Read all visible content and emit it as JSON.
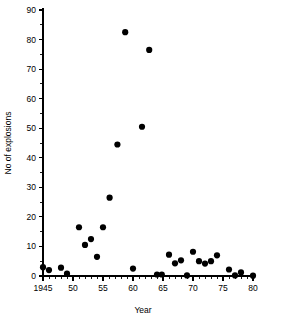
{
  "chart_data": {
    "type": "scatter",
    "title": "",
    "xlabel": "Year",
    "ylabel": "No of explosions",
    "xlim": [
      1945,
      1980
    ],
    "ylim": [
      0,
      90
    ],
    "grid": false,
    "legend": "none",
    "x_tick_labels": [
      "1945",
      "50",
      "55",
      "60",
      "65",
      "70",
      "75",
      "80"
    ],
    "x_tick_values": [
      1945,
      1950,
      1955,
      1960,
      1965,
      1970,
      1975,
      1980
    ],
    "x_minor_step": 1,
    "y_tick_labels": [
      "0",
      "10",
      "20",
      "30",
      "40",
      "50",
      "60",
      "70",
      "80",
      "90"
    ],
    "y_tick_values": [
      0,
      10,
      20,
      30,
      40,
      50,
      60,
      70,
      80,
      90
    ],
    "y_minor_step": 5,
    "marker": "filled-circle",
    "marker_color": "#000000",
    "marker_size_px": 3.1,
    "points": [
      {
        "x": 1945,
        "y": 3
      },
      {
        "x": 1946,
        "y": 2
      },
      {
        "x": 1948,
        "y": 2.8
      },
      {
        "x": 1949,
        "y": 0.8
      },
      {
        "x": 1951,
        "y": 16.5
      },
      {
        "x": 1952,
        "y": 10.5
      },
      {
        "x": 1953,
        "y": 12.5
      },
      {
        "x": 1954,
        "y": 6.5
      },
      {
        "x": 1955,
        "y": 16.5
      },
      {
        "x": 1956.1,
        "y": 26.5
      },
      {
        "x": 1957.4,
        "y": 44.5
      },
      {
        "x": 1958.7,
        "y": 82.5
      },
      {
        "x": 1960,
        "y": 2.5
      },
      {
        "x": 1961.5,
        "y": 50.5
      },
      {
        "x": 1962.7,
        "y": 76.5
      },
      {
        "x": 1964,
        "y": 0.5
      },
      {
        "x": 1964.8,
        "y": 0.5
      },
      {
        "x": 1966,
        "y": 7.2
      },
      {
        "x": 1967,
        "y": 4.3
      },
      {
        "x": 1968,
        "y": 5.3
      },
      {
        "x": 1969,
        "y": 0.2
      },
      {
        "x": 1970,
        "y": 8.2
      },
      {
        "x": 1971,
        "y": 5
      },
      {
        "x": 1972,
        "y": 4.2
      },
      {
        "x": 1973,
        "y": 5
      },
      {
        "x": 1974,
        "y": 7
      },
      {
        "x": 1976,
        "y": 2.2
      },
      {
        "x": 1977,
        "y": 0.2
      },
      {
        "x": 1978,
        "y": 1.2
      },
      {
        "x": 1980,
        "y": 0.1
      }
    ]
  },
  "axes": {
    "y_title": "No of explosions",
    "x_title": "Year"
  }
}
